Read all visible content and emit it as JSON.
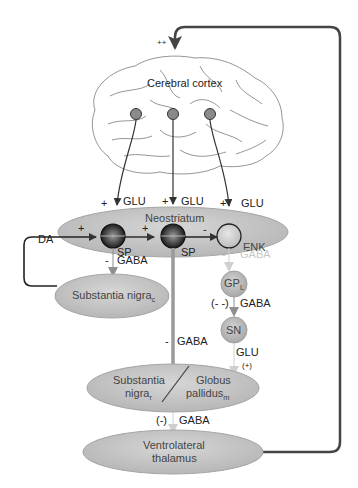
{
  "diagram": {
    "title_label": "Cerebral cortex",
    "feedback_sign": "++",
    "neostriatum": {
      "label": "Neostriatum",
      "inputs": [
        {
          "sign": "+",
          "transmitter": "GLU"
        },
        {
          "sign": "+",
          "transmitter": "GLU"
        },
        {
          "sign": "+",
          "transmitter": "GLU"
        }
      ],
      "neurons": [
        {
          "label": "SP"
        },
        {
          "label": "SP"
        },
        {
          "label": "ENK"
        }
      ],
      "internal_signs": [
        "+",
        "+",
        "-"
      ]
    },
    "da_label": "DA",
    "sp1_output": {
      "sign": "-",
      "transmitter": "GABA"
    },
    "snc": {
      "label": "Substantia nigra",
      "sub": "c"
    },
    "enk_output": {
      "sign": "-",
      "transmitter": "GABA"
    },
    "gpl": {
      "label": "GP",
      "sub": "L"
    },
    "gpl_output": {
      "sign": "(- -)",
      "transmitter": "GABA"
    },
    "sn": {
      "label": "SN"
    },
    "sn_output": {
      "transmitter": "GLU",
      "sign": "(+)"
    },
    "sp2_output": {
      "sign": "-",
      "transmitter": "GABA"
    },
    "output_nucleus": {
      "left_label_1": "Substantia",
      "left_label_2": "nigra",
      "left_sub": "r",
      "right_label_1": "Globus",
      "right_label_2": "pallidus",
      "right_sub": "m"
    },
    "output_connection": {
      "sign": "(-)",
      "transmitter": "GABA"
    },
    "thalamus": {
      "label_1": "Ventrolateral",
      "label_2": "thalamus"
    },
    "colors": {
      "ellipse_fill": "#c4c4c4",
      "ellipse_stroke": "#9a9a9a",
      "line_dark": "#333333",
      "line_grey": "#9a9a9a",
      "line_faint": "#d0d0d0"
    }
  }
}
